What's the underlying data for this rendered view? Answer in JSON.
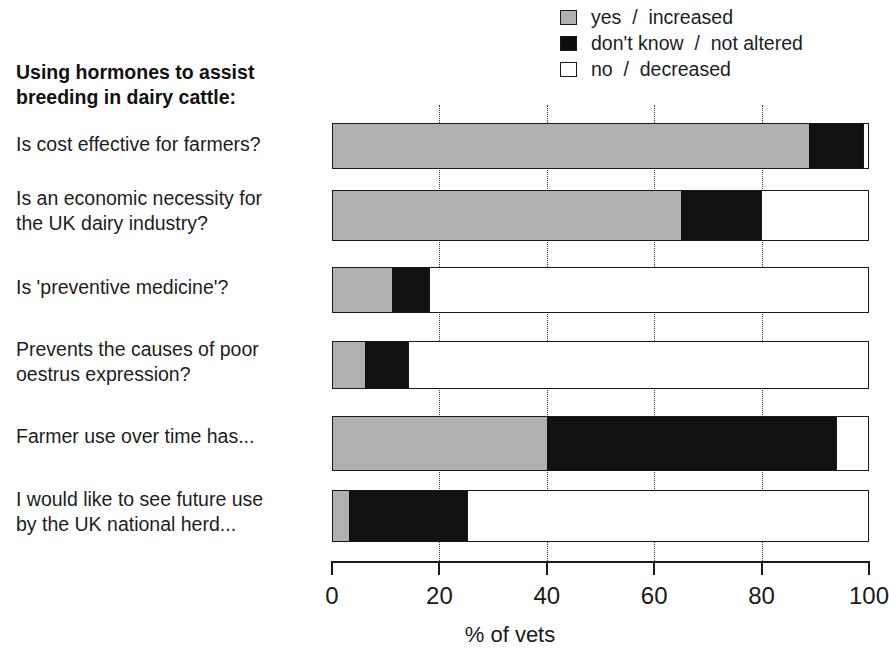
{
  "legend": {
    "position": "top-right",
    "items": [
      {
        "key": "yes",
        "label": "yes  /  increased",
        "color": "#b0b0b0",
        "icon": "square-swatch-gray"
      },
      {
        "key": "dont_know",
        "label": "don't know  /  not altered",
        "color": "#111111",
        "icon": "square-swatch-black"
      },
      {
        "key": "no",
        "label": "no  /  decreased",
        "color": "#ffffff",
        "icon": "square-swatch-white"
      }
    ]
  },
  "questions": {
    "heading_line1": "Using hormones to assist",
    "heading_line2": "breeding in dairy cattle:"
  },
  "axis": {
    "title": "% of vets",
    "ticks": [
      "0",
      "20",
      "40",
      "60",
      "80",
      "100"
    ]
  },
  "chart_data": {
    "type": "bar",
    "orientation": "horizontal",
    "stacked": true,
    "title": "Using hormones to assist breeding in dairy cattle:",
    "xlabel": "% of vets",
    "ylabel": "",
    "xlim": [
      0,
      100
    ],
    "grid": "vertical-dotted-at-20-40-60-80",
    "legend_position": "top-right",
    "categories": [
      "Is cost effective for farmers?",
      "Is an economic necessity for the UK dairy industry?",
      "Is 'preventive medicine'?",
      "Prevents the causes of poor oestrus expression?",
      "Farmer use over time has...",
      "I would like to see future use by the UK national herd..."
    ],
    "category_lines": [
      [
        "Is cost effective for farmers?"
      ],
      [
        "Is an economic necessity for",
        "the UK dairy industry?"
      ],
      [
        "Is 'preventive medicine'?"
      ],
      [
        "Prevents the causes of poor",
        "oestrus expression?"
      ],
      [
        "Farmer use over time has..."
      ],
      [
        "I would like to see future use",
        "by the UK national herd..."
      ]
    ],
    "series": [
      {
        "name": "yes  /  increased",
        "color": "#b0b0b0",
        "values": [
          89,
          65,
          11,
          6,
          40,
          3
        ]
      },
      {
        "name": "don't know  /  not altered",
        "color": "#111111",
        "values": [
          10,
          15,
          7,
          8,
          54,
          22
        ]
      },
      {
        "name": "no  /  decreased",
        "color": "#ffffff",
        "values": [
          1,
          20,
          82,
          86,
          6,
          75
        ]
      }
    ]
  }
}
